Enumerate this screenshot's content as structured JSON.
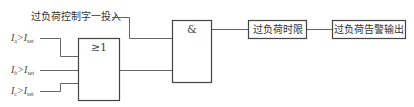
{
  "diagram": {
    "type": "logic-block-diagram",
    "control_input": {
      "label": "过负荷控制字一投入"
    },
    "conditions": [
      {
        "var": "I",
        "sub": "a",
        "op": ">",
        "ref": "I",
        "ref_sub": "set"
      },
      {
        "var": "I",
        "sub": "b",
        "op": ">",
        "ref": "I",
        "ref_sub": "set"
      },
      {
        "var": "I",
        "sub": "c",
        "op": ">",
        "ref": "I",
        "ref_sub": "set"
      }
    ],
    "or_gate": {
      "symbol": "≥1"
    },
    "and_gate": {
      "symbol": "&"
    },
    "timer_box": {
      "label": "过负荷时限"
    },
    "output_box": {
      "label": "过负荷告警输出"
    },
    "colors": {
      "line": "#555555",
      "box_border": "#444444",
      "background": "#ffffff"
    }
  }
}
